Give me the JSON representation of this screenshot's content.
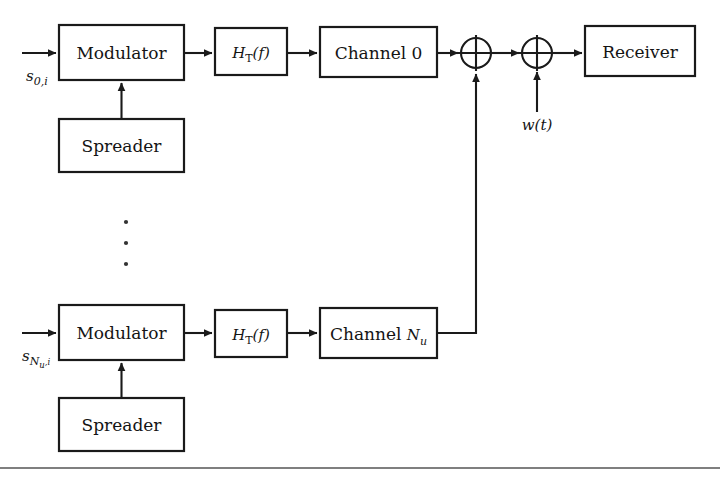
{
  "figure": {
    "background_color": "#ffffff",
    "line_color": "#1a1a1a",
    "text_color": "#141414"
  },
  "blocks": {
    "modulator_top": {
      "label": "Modulator"
    },
    "modulator_bottom": {
      "label": "Modulator"
    },
    "spreader_top": {
      "label": "Spreader"
    },
    "spreader_bottom": {
      "label": "Spreader"
    },
    "filter_top": {
      "label_main": "H",
      "label_sub": "T",
      "label_arg": "(f)"
    },
    "filter_bottom": {
      "label_main": "H",
      "label_sub": "T",
      "label_arg": "(f)"
    },
    "channel_top": {
      "label": "Channel 0"
    },
    "channel_bottom": {
      "label_main": "Channel ",
      "label_var": "N",
      "label_sub": "u"
    },
    "receiver": {
      "label": "Receiver"
    }
  },
  "signals": {
    "input_top": {
      "symbol": "s",
      "sub": "0,i"
    },
    "input_bottom": {
      "symbol": "s",
      "sub_var": "N",
      "sub_sub": "u",
      "sub_tail": ",i"
    },
    "noise": {
      "label": "w(t)"
    }
  },
  "adders": {
    "adder_users": {
      "operator": "+"
    },
    "adder_noise": {
      "operator": "+"
    }
  },
  "ellipsis": {
    "dots": 3
  }
}
